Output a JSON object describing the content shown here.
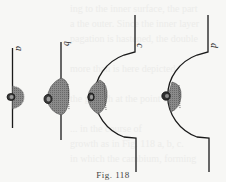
{
  "figure": {
    "caption": "Fig. 118",
    "labels": {
      "a": "a",
      "b": "b",
      "c": "c",
      "d": "d"
    },
    "colors": {
      "line": "#1a1a1a",
      "mass_fill": "#7a7a7a",
      "nucleus_fill": "#3a3a3a",
      "background": "#f7f7f5"
    },
    "panels": [
      {
        "id": "a",
        "shape": "straight-line",
        "mass": "small-bulge"
      },
      {
        "id": "b",
        "shape": "straight-line",
        "mass": "large-bulge"
      },
      {
        "id": "c",
        "shape": "semicircular-recess",
        "mass": "bulge-on-arc"
      },
      {
        "id": "d",
        "shape": "semicircular-recess",
        "mass": "bulge-on-arc-with-knob"
      }
    ]
  }
}
